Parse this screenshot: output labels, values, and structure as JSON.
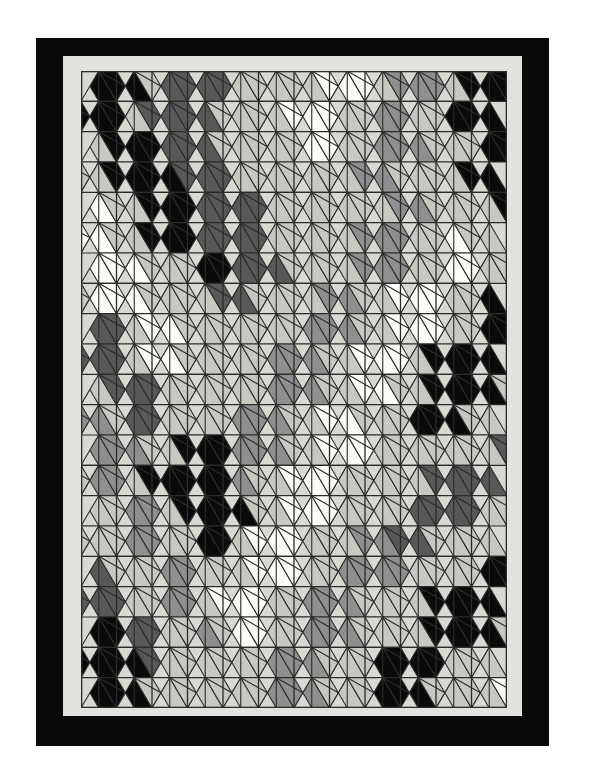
{
  "artwork": {
    "title": "Geometric Triangular Tessellation Quilt",
    "medium": "printed geometric pattern",
    "description": "Isometric triangular grid tessellation with pinwheel motifs in five grayscale tones"
  },
  "frame": {
    "outer_border_color": "#0a0a0a",
    "outer_border_label": "black outer frame",
    "mat_color": "#e2e2de",
    "mat_label": "light gray mat",
    "page_background": "#ffffff"
  },
  "palette": {
    "background": "#d9d9d4",
    "line": "#2b2b2b",
    "tones": [
      "#0a0a0a",
      "#585858",
      "#8f8f8f",
      "#c8c8c3",
      "#fbfbf8"
    ],
    "tone_names": [
      "black",
      "dark-gray",
      "medium-gray",
      "light-gray",
      "white"
    ]
  },
  "grid": {
    "columns": 12,
    "rows": 21,
    "cell_width": 35.5,
    "cell_height": 30.333,
    "plate_width": 426,
    "plate_height": 637,
    "line_width": 1.1,
    "note": "Isometric triangular lattice; each upward/downward triangle is split into a parallelogram plus a small corner triangle"
  },
  "chart_data": {
    "type": "heatmap",
    "xlabel": "",
    "ylabel": "",
    "legend": [
      "black",
      "dark-gray",
      "medium-gray",
      "light-gray",
      "white"
    ],
    "tone_index_legend": {
      "0": "black",
      "1": "dark-gray",
      "2": "medium-gray",
      "3": "light-gray",
      "4": "white"
    },
    "rows": 21,
    "cols": 24,
    "note": "Each row holds 24 half-cell triangle tone indices (alternating up/down triangles across the row).",
    "values": [
      [
        0,
        0,
        0,
        3,
        1,
        1,
        1,
        1,
        3,
        3,
        3,
        3,
        3,
        4,
        4,
        4,
        3,
        2,
        2,
        2,
        3,
        0,
        0,
        0
      ],
      [
        0,
        0,
        0,
        3,
        1,
        1,
        1,
        1,
        3,
        3,
        3,
        3,
        4,
        4,
        4,
        3,
        3,
        2,
        2,
        3,
        3,
        0,
        0,
        0
      ],
      [
        3,
        0,
        0,
        0,
        1,
        1,
        1,
        3,
        3,
        3,
        3,
        3,
        4,
        4,
        3,
        3,
        2,
        2,
        2,
        3,
        3,
        3,
        0,
        0
      ],
      [
        3,
        3,
        0,
        0,
        0,
        0,
        1,
        1,
        1,
        3,
        3,
        3,
        3,
        3,
        3,
        3,
        2,
        2,
        3,
        3,
        3,
        3,
        0,
        0
      ],
      [
        4,
        3,
        3,
        0,
        0,
        0,
        1,
        1,
        1,
        1,
        3,
        3,
        3,
        3,
        3,
        3,
        3,
        2,
        2,
        3,
        3,
        3,
        3,
        0
      ],
      [
        4,
        4,
        3,
        3,
        0,
        0,
        0,
        1,
        1,
        1,
        1,
        3,
        3,
        3,
        3,
        3,
        2,
        2,
        2,
        3,
        3,
        4,
        3,
        3
      ],
      [
        4,
        4,
        4,
        3,
        3,
        3,
        0,
        0,
        1,
        1,
        1,
        3,
        3,
        3,
        3,
        2,
        2,
        2,
        3,
        3,
        4,
        4,
        3,
        3
      ],
      [
        3,
        4,
        4,
        4,
        3,
        3,
        3,
        3,
        1,
        1,
        3,
        3,
        3,
        3,
        2,
        2,
        3,
        3,
        4,
        4,
        4,
        3,
        3,
        0
      ],
      [
        1,
        1,
        3,
        4,
        4,
        3,
        3,
        3,
        3,
        3,
        3,
        3,
        2,
        2,
        2,
        3,
        3,
        4,
        4,
        4,
        3,
        3,
        0,
        0
      ],
      [
        1,
        1,
        1,
        3,
        4,
        4,
        3,
        3,
        3,
        3,
        3,
        2,
        2,
        2,
        3,
        3,
        4,
        4,
        4,
        3,
        0,
        0,
        0,
        0
      ],
      [
        3,
        1,
        1,
        1,
        3,
        3,
        3,
        3,
        3,
        3,
        2,
        2,
        2,
        3,
        3,
        4,
        4,
        3,
        3,
        0,
        0,
        0,
        0,
        3
      ],
      [
        2,
        2,
        3,
        1,
        1,
        3,
        3,
        3,
        3,
        2,
        2,
        2,
        3,
        3,
        4,
        4,
        3,
        3,
        3,
        0,
        0,
        0,
        3,
        3
      ],
      [
        2,
        2,
        2,
        3,
        3,
        0,
        0,
        0,
        2,
        2,
        2,
        3,
        3,
        4,
        4,
        4,
        3,
        3,
        3,
        3,
        3,
        3,
        3,
        1
      ],
      [
        3,
        2,
        2,
        3,
        0,
        0,
        0,
        0,
        0,
        2,
        3,
        3,
        4,
        4,
        4,
        3,
        3,
        3,
        3,
        3,
        1,
        1,
        1,
        1
      ],
      [
        3,
        3,
        2,
        2,
        3,
        0,
        0,
        0,
        0,
        3,
        3,
        4,
        4,
        4,
        3,
        3,
        3,
        3,
        1,
        1,
        1,
        1,
        3,
        3
      ],
      [
        3,
        3,
        3,
        2,
        2,
        3,
        3,
        0,
        0,
        3,
        4,
        4,
        4,
        3,
        3,
        3,
        2,
        2,
        1,
        1,
        3,
        3,
        3,
        3
      ],
      [
        1,
        3,
        3,
        3,
        2,
        2,
        3,
        3,
        3,
        4,
        4,
        4,
        3,
        3,
        2,
        2,
        2,
        2,
        3,
        3,
        3,
        3,
        0,
        0
      ],
      [
        1,
        1,
        1,
        3,
        3,
        2,
        2,
        3,
        4,
        4,
        4,
        3,
        3,
        2,
        2,
        2,
        3,
        3,
        3,
        3,
        0,
        0,
        0,
        0
      ],
      [
        0,
        0,
        1,
        1,
        3,
        3,
        2,
        3,
        4,
        4,
        3,
        3,
        2,
        2,
        2,
        3,
        3,
        3,
        3,
        0,
        0,
        0,
        0,
        3
      ],
      [
        0,
        0,
        0,
        0,
        1,
        3,
        3,
        3,
        3,
        3,
        3,
        2,
        2,
        2,
        3,
        3,
        3,
        0,
        0,
        0,
        0,
        3,
        3,
        3
      ],
      [
        0,
        0,
        0,
        3,
        3,
        3,
        3,
        3,
        3,
        3,
        2,
        2,
        2,
        3,
        3,
        3,
        0,
        0,
        0,
        3,
        3,
        3,
        3,
        4
      ]
    ]
  }
}
